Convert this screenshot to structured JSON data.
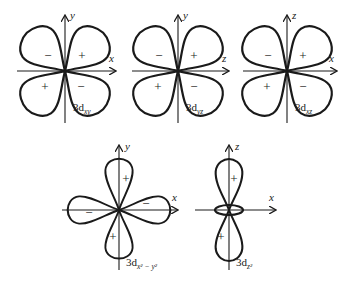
{
  "figure": {
    "orbitals": [
      {
        "name_main": "3d",
        "name_sub": "xy",
        "vertical_axis": "y",
        "horizontal_axis": "x",
        "signs": {
          "upper_left": "−",
          "upper_right": "+",
          "lower_left": "+",
          "lower_right": "−"
        }
      },
      {
        "name_main": "3d",
        "name_sub": "yz",
        "vertical_axis": "y",
        "horizontal_axis": "z",
        "signs": {
          "upper_left": "−",
          "upper_right": "+",
          "lower_left": "+",
          "lower_right": "−"
        }
      },
      {
        "name_main": "3d",
        "name_sub": "xz",
        "vertical_axis": "z",
        "horizontal_axis": "x",
        "signs": {
          "upper_left": "−",
          "upper_right": "+",
          "lower_left": "+",
          "lower_right": "−"
        }
      },
      {
        "name_main": "3d",
        "name_sub": "x² − y²",
        "vertical_axis": "y",
        "horizontal_axis": "x",
        "signs": {
          "top": "+",
          "bottom": "+",
          "left": "−",
          "right": "−"
        }
      },
      {
        "name_main": "3d",
        "name_sub": "z²",
        "vertical_axis": "z",
        "horizontal_axis": "x",
        "signs": {
          "top": "+",
          "bottom": "+"
        }
      }
    ]
  }
}
